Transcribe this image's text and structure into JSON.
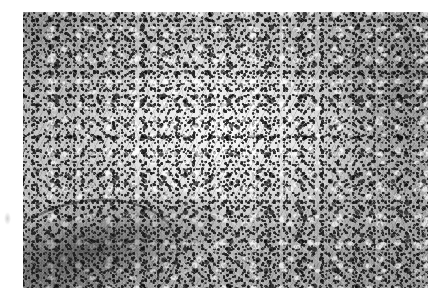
{
  "figure": {
    "kind": "photomicrograph",
    "modality": "light microscopy",
    "stain_appearance": "monochrome / grayscale halftone",
    "caption": "",
    "label": "",
    "scale_bar": "",
    "magnification": "",
    "alt_text": "Grayscale histopathology photomicrograph of densely cellular tissue. A pale, less cellular zone occupies the centre of the field, surrounded by dark, densely packed nuclei that are most concentrated along the right and upper-left margins. A dark curved fibrous band crosses the lower-left corner."
  },
  "plate": {
    "background_color": "#ffffff",
    "image_tone_light": "#f0f0f0",
    "image_tone_mid": "#c6c6c6",
    "image_tone_dark": "#1e1e1e",
    "border": "none"
  },
  "regions": [
    {
      "name": "central-pale-zone",
      "description": "pale, hypocellular central area with scattered dark nuclei",
      "position": "center",
      "relative_density": "low"
    },
    {
      "name": "right-dense-zone",
      "description": "densely cellular field with crowded dark nuclei",
      "position": "right",
      "relative_density": "high"
    },
    {
      "name": "upper-left-dense-zone",
      "description": "dense cellular infiltrate with coarse dark chromatin",
      "position": "upper-left",
      "relative_density": "high"
    },
    {
      "name": "lower-left-fibrous-band",
      "description": "dark curved fibrous / collagenous band sweeping across the corner",
      "position": "lower-left",
      "relative_density": "high"
    },
    {
      "name": "lower-right-dense-zone",
      "description": "moderately dense cellular tissue",
      "position": "lower-right",
      "relative_density": "medium"
    }
  ],
  "margin_artifacts": [
    {
      "name": "left-margin-smudge",
      "description": "faint gray scanning smudge in the white page margin",
      "position": "left margin"
    }
  ]
}
